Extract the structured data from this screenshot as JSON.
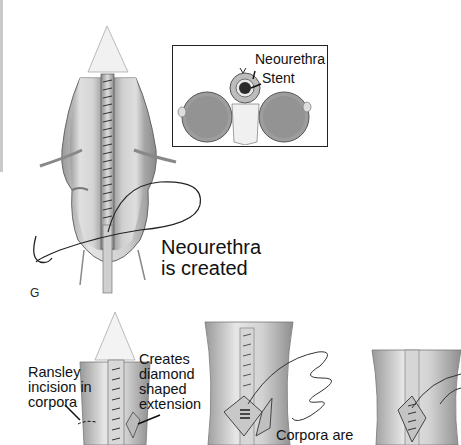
{
  "figure": {
    "panel_top": {
      "panel_letter": "G",
      "caption_line1": "Neourethra",
      "caption_line2": "is created",
      "inset": {
        "label_neourethra": "Neourethra",
        "label_stent": "Stent"
      }
    },
    "panel_bottom": {
      "left_label_line1": "Ransley",
      "left_label_line2": "incision in",
      "left_label_line3": "corpora",
      "right_label_line1": "Creates",
      "right_label_line2": "diamond",
      "right_label_line3": "shaped",
      "right_label_line4": "extension",
      "middle_label": "Corpora are"
    }
  },
  "colors": {
    "tissue_light": "#e6e6e6",
    "tissue_mid": "#b8b8b8",
    "tissue_dark": "#7a7a7a",
    "line": "#222222",
    "side_bar": "#c9c9c9"
  }
}
